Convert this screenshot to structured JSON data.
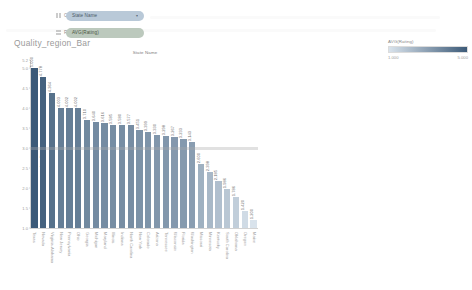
{
  "shelves": [
    {
      "icon": "columns-icon",
      "label": "Columns",
      "pill": {
        "text": "State Name",
        "caret": "▾",
        "kind": "dimension"
      }
    },
    {
      "icon": "rows-icon",
      "label": "Rows",
      "pill": {
        "text": "AVG(Rating)",
        "caret": "",
        "kind": "measure"
      }
    }
  ],
  "sheet_title": "Quality_region_Bar",
  "legend": {
    "title": "AVG(Rating)",
    "min_label": "1.000",
    "max_label": "5.000",
    "color_low": "#d9e3ec",
    "color_high": "#3c5a78"
  },
  "chart_data": {
    "type": "bar",
    "title": "Quality_region_Bar",
    "column_header": "State Name",
    "xlabel": "State Name",
    "ylabel": "Avg. Rating",
    "ylim": [
      1.0,
      5.2
    ],
    "yticks": [
      "5.2",
      "5.0",
      "4.5",
      "4.0",
      "3.5",
      "3.0",
      "2.5",
      "2.0",
      "1.5",
      "1.0"
    ],
    "ytick_values": [
      5.2,
      5.0,
      4.5,
      4.0,
      3.5,
      3.0,
      2.5,
      2.0,
      1.5,
      1.0
    ],
    "grid": false,
    "legend_position": "right",
    "reference_line": 3.0,
    "categories": [
      "Texas",
      "Nevada",
      "Virginia-Alabama",
      "New Jersey",
      "Pennsylvania",
      "Ohio",
      "Georgia",
      "Michigan",
      "Maryland",
      "Illinois",
      "Indiana",
      "North Carolina",
      "New York",
      "Colorado",
      "Arizona",
      "Tennessee",
      "Wisconsin",
      "Florida",
      "Washington",
      "Missouri",
      "Minnesota",
      "Kentucky",
      "South Carolina",
      "Oklahoma",
      "Oregon",
      "Maine"
    ],
    "values": [
      5.0,
      4.778,
      4.364,
      4.003,
      4.002,
      4.002,
      3.71,
      3.64,
      3.616,
      3.585,
      3.58,
      3.577,
      3.451,
      3.399,
      3.33,
      3.298,
      3.267,
      3.233,
      3.143,
      2.6,
      2.398,
      2.185,
      1.986,
      1.786,
      1.42,
      1.2
    ],
    "value_labels": [
      "5.000",
      "4.778",
      "4.364",
      "4.003",
      "4.002",
      "4.002",
      "3.710",
      "3.640",
      "3.616",
      "3.585",
      "3.580",
      "3.577",
      "3.451",
      "3.399",
      "3.330",
      "3.298",
      "3.267",
      "3.233",
      "3.143",
      "2.600",
      "2.398",
      "2.185",
      "1.986",
      "1.786",
      "1.420",
      "1.200"
    ]
  }
}
